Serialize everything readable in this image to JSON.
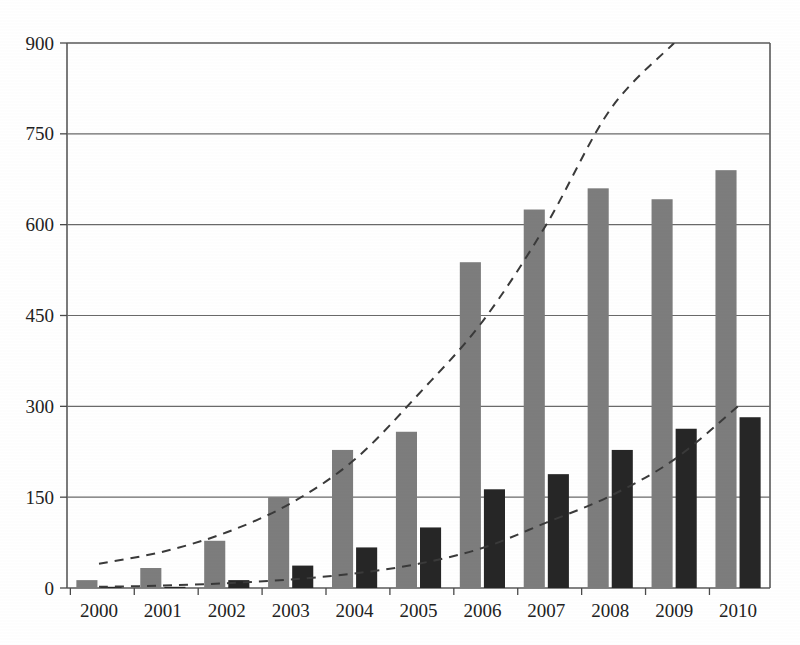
{
  "chart_data": {
    "type": "bar",
    "title": "",
    "subtitle": "",
    "xlabel": "",
    "ylabel": "",
    "categories": [
      "2000",
      "2001",
      "2002",
      "2003",
      "2004",
      "2005",
      "2006",
      "2007",
      "2008",
      "2009",
      "2010"
    ],
    "ylim": [
      0,
      900
    ],
    "yticks": [
      0,
      150,
      300,
      450,
      600,
      750,
      900
    ],
    "ytick_labels": [
      "0",
      "150",
      "300",
      "450",
      "600",
      "750",
      "900"
    ],
    "grid": "horizontal",
    "legend": "none",
    "series": [
      {
        "name": "series-1",
        "color": "#7d7d7d",
        "values": [
          13,
          33,
          78,
          150,
          228,
          258,
          538,
          625,
          660,
          642,
          690
        ]
      },
      {
        "name": "series-2",
        "color": "#262626",
        "values": [
          2,
          2,
          13,
          37,
          67,
          100,
          163,
          188,
          228,
          263,
          282
        ]
      }
    ],
    "trendlines": [
      {
        "name": "upper-dashed-trend",
        "style": "dashed",
        "color": "#3a3a3a",
        "x": [
          "2000",
          "2001",
          "2002",
          "2003",
          "2004",
          "2005",
          "2006",
          "2007",
          "2008",
          "2009"
        ],
        "values": [
          40,
          60,
          92,
          140,
          212,
          320,
          440,
          600,
          790,
          900
        ]
      },
      {
        "name": "lower-dashed-trend",
        "style": "dashed",
        "color": "#3a3a3a",
        "x": [
          "2000",
          "2001",
          "2002",
          "2003",
          "2004",
          "2005",
          "2006",
          "2007",
          "2008",
          "2009",
          "2010"
        ],
        "values": [
          2,
          4,
          8,
          14,
          24,
          40,
          66,
          108,
          152,
          212,
          300
        ]
      }
    ]
  },
  "axis": {
    "y_label_000": "0",
    "y_label_150": "150",
    "y_label_300": "300",
    "y_label_450": "450",
    "y_label_600": "600",
    "y_label_750": "750",
    "y_label_900": "900"
  },
  "colors": {
    "primary_bar": "#7d7d7d",
    "secondary_bar": "#262626",
    "axis": "#5a5a5a",
    "grid": "#6a6a6a",
    "trend": "#3a3a3a",
    "background": "#ffffff"
  }
}
